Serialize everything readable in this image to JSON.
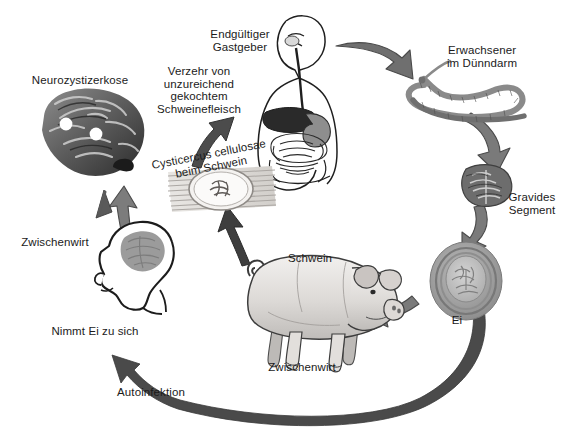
{
  "diagram": {
    "language": "de",
    "background_color": "#ffffff",
    "text_color": "#1b1b1b",
    "arrow_color": "#6e6e6e",
    "arrow_outline_color": "#3f3f3f"
  },
  "labels": {
    "neurocysticercosis": "Neurozystizerkose",
    "consumption": "Verzehr von\nunzureichend\ngekochtem\nSchweinefleisch",
    "definitive_host": "Endgültiger\nGastgeber",
    "adult_worm": "Erwachsener\nim Dünndarm",
    "gravid_segment": "Gravides\nSegment",
    "egg": "Ei",
    "cysticercus": "Cysticercus cellulosae\nbeim Schwein",
    "pig": "Schwein",
    "pig_intermediate_host": "Zwischenwirt",
    "human_intermediate_host": "Zwischenwirt",
    "ingests_egg": "Nimmt Ei zu sich",
    "autoinfection": "Autoinfektion"
  },
  "nodes": [
    {
      "name": "brain-neurocysticercosis",
      "label": "Neurozystizerkose",
      "kind": "image-brain"
    },
    {
      "name": "human-definitive-host",
      "label": "Endgültiger Gastgeber",
      "kind": "image-human-torso"
    },
    {
      "name": "adult-tapeworm",
      "label": "Erwachsener im Dünndarm",
      "kind": "image-tapeworm"
    },
    {
      "name": "gravid-proglottid",
      "label": "Gravides Segment",
      "kind": "image-proglottid"
    },
    {
      "name": "taenia-egg",
      "label": "Ei",
      "kind": "image-egg"
    },
    {
      "name": "pig",
      "label": "Schwein / Zwischenwirt",
      "kind": "image-pig"
    },
    {
      "name": "cysticercus-in-muscle",
      "label": "Cysticercus cellulosae beim Schwein",
      "kind": "image-cyst"
    },
    {
      "name": "human-head-intermediate-host",
      "label": "Zwischenwirt",
      "kind": "image-head-profile"
    }
  ],
  "arrows": [
    {
      "name": "arrow-human-to-tapeworm",
      "from": "human-definitive-host",
      "to": "adult-tapeworm"
    },
    {
      "name": "arrow-tapeworm-to-segment",
      "from": "adult-tapeworm",
      "to": "gravid-proglottid"
    },
    {
      "name": "arrow-segment-to-egg",
      "from": "gravid-proglottid",
      "to": "taenia-egg"
    },
    {
      "name": "arrow-egg-to-pig",
      "from": "taenia-egg",
      "to": "pig"
    },
    {
      "name": "arrow-pig-to-cysticercus",
      "from": "pig",
      "to": "cysticercus-in-muscle"
    },
    {
      "name": "arrow-cysticercus-to-human",
      "from": "cysticercus-in-muscle",
      "to": "human-definitive-host"
    },
    {
      "name": "arrow-cysticercus-to-brain",
      "from": "cysticercus-in-muscle",
      "to": "brain-neurocysticercosis"
    },
    {
      "name": "arrow-head-to-brain",
      "from": "human-head-intermediate-host",
      "to": "brain-neurocysticercosis"
    },
    {
      "name": "arrow-autoinfection-to-head",
      "from": "taenia-egg",
      "to": "human-head-intermediate-host",
      "label": "Autoinfektion"
    }
  ]
}
